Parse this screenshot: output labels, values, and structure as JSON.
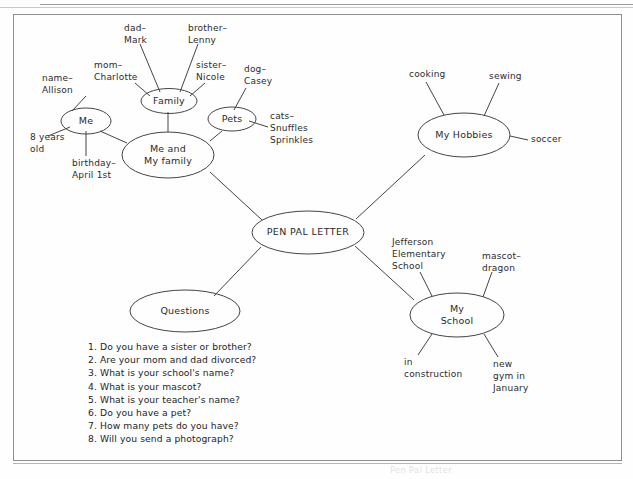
{
  "document": {
    "type": "mind-map-worksheet",
    "footer_ghost_text": "Pen Pal Letter"
  },
  "center_node": {
    "label": "PEN PAL LETTER"
  },
  "branches": [
    {
      "id": "me-and-my-family",
      "label": "Me and\nMy family",
      "children": [
        {
          "id": "me",
          "label": "Me",
          "leaves": [
            {
              "id": "name",
              "text": "name–\nAllison"
            },
            {
              "id": "age",
              "text": "8 years\nold"
            },
            {
              "id": "birthday",
              "text": "birthday–\nApril 1st"
            }
          ]
        },
        {
          "id": "family",
          "label": "Family",
          "leaves": [
            {
              "id": "mom",
              "text": "mom–\nCharlotte"
            },
            {
              "id": "dad",
              "text": "dad–\nMark"
            },
            {
              "id": "brother",
              "text": "brother–\nLenny"
            },
            {
              "id": "sister",
              "text": "sister–\nNicole"
            }
          ]
        },
        {
          "id": "pets",
          "label": "Pets",
          "leaves": [
            {
              "id": "dog",
              "text": "dog–\nCasey"
            },
            {
              "id": "cats",
              "text": "cats–\nSnuffles\nSprinkles"
            }
          ]
        }
      ]
    },
    {
      "id": "my-hobbies",
      "label": "My Hobbies",
      "leaves": [
        {
          "id": "cooking",
          "text": "cooking"
        },
        {
          "id": "sewing",
          "text": "sewing"
        },
        {
          "id": "soccer",
          "text": "soccer"
        }
      ]
    },
    {
      "id": "my-school",
      "label": "My\nSchool",
      "leaves": [
        {
          "id": "school-name",
          "text": "Jefferson\nElementary\nSchool"
        },
        {
          "id": "mascot",
          "text": "mascot–\ndragon"
        },
        {
          "id": "construction",
          "text": "in\nconstruction"
        },
        {
          "id": "new-gym",
          "text": "new\ngym in\nJanuary"
        }
      ]
    },
    {
      "id": "questions",
      "label": "Questions",
      "items": [
        "1. Do you have a sister or brother?",
        "2. Are your mom and dad divorced?",
        "3. What is your school's name?",
        "4. What is your mascot?",
        "5. What is your teacher's name?",
        "6. Do you have a pet?",
        "7. How many pets do you have?",
        "8. Will you send a photograph?"
      ]
    }
  ],
  "colors": {
    "ink": "#2b2b2b",
    "stroke": "#444444",
    "paper": "#fefefe",
    "frame": "#8d8d8d"
  }
}
